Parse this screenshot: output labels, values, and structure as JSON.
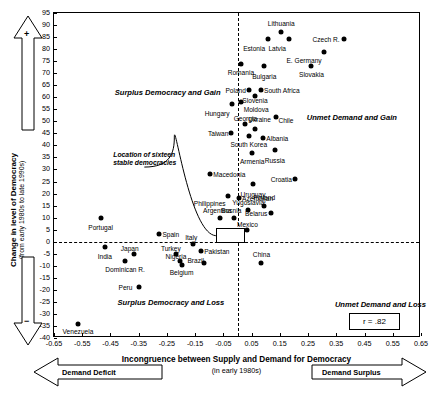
{
  "chart_data": {
    "type": "scatter",
    "title": "",
    "xlabel": "Incongruence between Supply and Demand for Democracy",
    "xlabel_sub": "(in early 1980s)",
    "ylabel": "Change in level of Democracy",
    "ylabel_sub": "(from early 1980s to late 1990s)",
    "xlim": [
      -0.65,
      0.65
    ],
    "ylim": [
      -40,
      95
    ],
    "xticks": [
      "-0.65",
      "-0.55",
      "-0.45",
      "-0.35",
      "-0.25",
      "-0.15",
      "-0.05",
      "0.05",
      "0.15",
      "0.25",
      "0.35",
      "0.45",
      "0.55",
      "0.65"
    ],
    "xtickvals": [
      -0.65,
      -0.55,
      -0.45,
      -0.35,
      -0.25,
      -0.15,
      -0.05,
      0.05,
      0.15,
      0.25,
      0.35,
      0.45,
      0.55,
      0.65
    ],
    "yticks": [
      "95",
      "90",
      "85",
      "80",
      "75",
      "70",
      "65",
      "60",
      "55",
      "50",
      "45",
      "40",
      "35",
      "30",
      "25",
      "20",
      "15",
      "10",
      "5",
      "0",
      "-5",
      "-10",
      "-15",
      "-20",
      "-25",
      "-30",
      "-35",
      "-40"
    ],
    "ytickvals": [
      95,
      90,
      85,
      80,
      75,
      70,
      65,
      60,
      55,
      50,
      45,
      40,
      35,
      30,
      25,
      20,
      15,
      10,
      5,
      0,
      -5,
      -10,
      -15,
      -20,
      -25,
      -30,
      -35,
      -40
    ],
    "grid": false,
    "legend": "none",
    "annotation_r": "r = .82",
    "reference_lines": {
      "vertical_x": 0.0,
      "horizontal_y": 0.0
    },
    "quadrant_labels": [
      {
        "text": "Surplus Democracy and Gain",
        "x": -0.435,
        "y": 62
      },
      {
        "text": "Unmet Demand and Gain",
        "x": 0.245,
        "y": 52
      },
      {
        "text": "Surplus Democracy and Loss",
        "x": -0.425,
        "y": -25
      },
      {
        "text": "Unmet Demand and Loss",
        "x": 0.345,
        "y": -26
      }
    ],
    "callout": {
      "line1": "Location of sixteen",
      "line2": "stable democracies",
      "x": -0.44,
      "y": 35
    },
    "points": [
      {
        "label": "Lithuania",
        "x": 0.155,
        "y": 87,
        "lx": 0.155,
        "ly": 91,
        "anchor": "c"
      },
      {
        "label": "Estonia",
        "x": 0.108,
        "y": 84,
        "lx": 0.098,
        "ly": 80.5,
        "anchor": "r"
      },
      {
        "label": "Latvia",
        "x": 0.182,
        "y": 84,
        "lx": 0.172,
        "ly": 80.5,
        "anchor": "r"
      },
      {
        "label": "Czech R.",
        "x": 0.378,
        "y": 84,
        "lx": 0.362,
        "ly": 84,
        "anchor": "r"
      },
      {
        "label": "E. Germany",
        "x": 0.305,
        "y": 79,
        "lx": 0.298,
        "ly": 75.5,
        "anchor": "r"
      },
      {
        "label": "Romania",
        "x": 0.012,
        "y": 74,
        "lx": 0.012,
        "ly": 70.5,
        "anchor": "c"
      },
      {
        "label": "Bulgaria",
        "x": 0.095,
        "y": 73,
        "lx": 0.095,
        "ly": 69,
        "anchor": "c"
      },
      {
        "label": "Slovakia",
        "x": 0.262,
        "y": 73,
        "lx": 0.262,
        "ly": 69.5,
        "anchor": "c"
      },
      {
        "label": "Poland",
        "x": 0.042,
        "y": 63,
        "lx": 0.03,
        "ly": 63,
        "anchor": "r"
      },
      {
        "label": "South Africa",
        "x": 0.082,
        "y": 63,
        "lx": 0.094,
        "ly": 63,
        "anchor": "l"
      },
      {
        "label": "Slovenia",
        "x": 0.062,
        "y": 60.5,
        "lx": 0.062,
        "ly": 59,
        "anchor": "c"
      },
      {
        "label": "Hungary",
        "x": -0.018,
        "y": 57,
        "lx": -0.028,
        "ly": 53.5,
        "anchor": "r"
      },
      {
        "label": "Moldova",
        "x": 0.012,
        "y": 58,
        "lx": 0.022,
        "ly": 55,
        "anchor": "l"
      },
      {
        "label": "Chile",
        "x": 0.135,
        "y": 52,
        "lx": 0.145,
        "ly": 50.5,
        "anchor": "l"
      },
      {
        "label": "Georgia",
        "x": 0.028,
        "y": 49,
        "lx": 0.028,
        "ly": 51.5,
        "anchor": "c"
      },
      {
        "label": "Ukraine",
        "x": 0.062,
        "y": 47,
        "lx": 0.078,
        "ly": 51,
        "anchor": "c"
      },
      {
        "label": "Taiwan",
        "x": -0.022,
        "y": 45,
        "lx": -0.032,
        "ly": 45,
        "anchor": "r"
      },
      {
        "label": "South Korea",
        "x": 0.04,
        "y": 44,
        "lx": 0.04,
        "ly": 40.5,
        "anchor": "c"
      },
      {
        "label": "Albania",
        "x": 0.092,
        "y": 43,
        "lx": 0.102,
        "ly": 43,
        "anchor": "l"
      },
      {
        "label": "Armenia",
        "x": 0.052,
        "y": 37,
        "lx": 0.052,
        "ly": 33.5,
        "anchor": "c"
      },
      {
        "label": "Russia",
        "x": 0.132,
        "y": 38,
        "lx": 0.132,
        "ly": 34,
        "anchor": "c"
      },
      {
        "label": "Macedonia",
        "x": -0.098,
        "y": 28,
        "lx": -0.086,
        "ly": 28,
        "anchor": "l"
      },
      {
        "label": "Croatia",
        "x": 0.205,
        "y": 26,
        "lx": 0.193,
        "ly": 26,
        "anchor": "r"
      },
      {
        "label": "Uruguay",
        "x": 0.055,
        "y": 24,
        "lx": 0.055,
        "ly": 20,
        "anchor": "c"
      },
      {
        "label": "Philippines",
        "x": -0.032,
        "y": 19,
        "lx": -0.042,
        "ly": 16,
        "anchor": "r"
      },
      {
        "label": "Azerbaijan",
        "x": 0.005,
        "y": 18,
        "lx": 0.016,
        "ly": 18,
        "anchor": "l"
      },
      {
        "label": "Finland",
        "x": 0.095,
        "y": 15,
        "lx": 0.095,
        "ly": 18.5,
        "anchor": "c"
      },
      {
        "label": "Yugoslavia",
        "x": 0.038,
        "y": 13,
        "lx": 0.038,
        "ly": 16.5,
        "anchor": "c"
      },
      {
        "label": "Belarus",
        "x": 0.118,
        "y": 12,
        "lx": 0.106,
        "ly": 12,
        "anchor": "r"
      },
      {
        "label": "Argentina",
        "x": -0.062,
        "y": 10,
        "lx": -0.072,
        "ly": 13,
        "anchor": "c"
      },
      {
        "label": "Bosnia",
        "x": -0.012,
        "y": 10,
        "lx": -0.022,
        "ly": 13,
        "anchor": "c"
      },
      {
        "label": "Portugal",
        "x": -0.485,
        "y": 10,
        "lx": -0.485,
        "ly": 6,
        "anchor": "c"
      },
      {
        "label": "Mexico",
        "x": 0.035,
        "y": 5,
        "lx": 0.035,
        "ly": 7.5,
        "anchor": "c"
      },
      {
        "label": "Spain",
        "x": -0.278,
        "y": 3,
        "lx": -0.266,
        "ly": 3,
        "anchor": "l"
      },
      {
        "label": "Italy",
        "x": -0.158,
        "y": -1,
        "lx": -0.164,
        "ly": 2,
        "anchor": "c"
      },
      {
        "label": "India",
        "x": -0.47,
        "y": -2,
        "lx": -0.47,
        "ly": -6,
        "anchor": "c"
      },
      {
        "label": "Japan",
        "x": -0.368,
        "y": -5,
        "lx": -0.382,
        "ly": -2.5,
        "anchor": "c"
      },
      {
        "label": "Turkey",
        "x": -0.218,
        "y": -5,
        "lx": -0.236,
        "ly": -2.5,
        "anchor": "c"
      },
      {
        "label": "Pakistan",
        "x": -0.128,
        "y": -4,
        "lx": -0.118,
        "ly": -4,
        "anchor": "l"
      },
      {
        "label": "Nigeria",
        "x": -0.205,
        "y": -8,
        "lx": -0.218,
        "ly": -6,
        "anchor": "c"
      },
      {
        "label": "Brazil",
        "x": -0.118,
        "y": -9,
        "lx": -0.148,
        "ly": -7.5,
        "anchor": "c"
      },
      {
        "label": "Belgium",
        "x": -0.198,
        "y": -9.5,
        "lx": -0.198,
        "ly": -12.5,
        "anchor": "c"
      },
      {
        "label": "Dominican R.",
        "x": -0.398,
        "y": -8,
        "lx": -0.398,
        "ly": -11.5,
        "anchor": "c"
      },
      {
        "label": "China",
        "x": 0.085,
        "y": -9,
        "lx": 0.085,
        "ly": -5,
        "anchor": "c"
      },
      {
        "label": "Peru",
        "x": -0.35,
        "y": -19,
        "lx": -0.372,
        "ly": -19,
        "anchor": "r"
      },
      {
        "label": "Venezuela",
        "x": -0.565,
        "y": -34,
        "lx": -0.565,
        "ly": -37,
        "anchor": "c"
      }
    ]
  },
  "axis_arrows": {
    "y_positive_sign": "+",
    "y_negative_sign": "−",
    "x_left_label": "Demand Deficit",
    "x_right_label": "Demand Surplus"
  }
}
